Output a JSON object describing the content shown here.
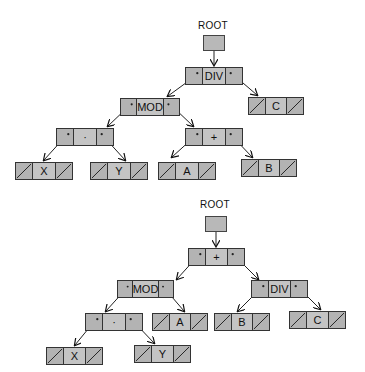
{
  "diagram": {
    "type": "expression-tree-linked-list",
    "trees": [
      {
        "root_label": "ROOT",
        "nodes": {
          "div": {
            "value": "DIV",
            "left": "mod",
            "right": "c"
          },
          "mod": {
            "value": "MOD",
            "left": "times",
            "right": "plus"
          },
          "times": {
            "value": "·",
            "left": "x",
            "right": "y"
          },
          "plus": {
            "value": "+",
            "left": "a",
            "right": "b"
          },
          "x": {
            "value": "X",
            "left": null,
            "right": null
          },
          "y": {
            "value": "Y",
            "left": null,
            "right": null
          },
          "a": {
            "value": "A",
            "left": null,
            "right": null
          },
          "b": {
            "value": "B",
            "left": null,
            "right": null
          },
          "c": {
            "value": "C",
            "left": null,
            "right": null
          }
        }
      },
      {
        "root_label": "ROOT",
        "nodes": {
          "plus": {
            "value": "+",
            "left": "mod",
            "right": "div"
          },
          "mod": {
            "value": "MOD",
            "left": "times",
            "right": "a"
          },
          "div": {
            "value": "DIV",
            "left": "b",
            "right": "c"
          },
          "times": {
            "value": "·",
            "left": "x",
            "right": "y"
          },
          "x": {
            "value": "X",
            "left": null,
            "right": null
          },
          "y": {
            "value": "Y",
            "left": null,
            "right": null
          },
          "a": {
            "value": "A",
            "left": null,
            "right": null
          },
          "b": {
            "value": "B",
            "left": null,
            "right": null
          },
          "c": {
            "value": "C",
            "left": null,
            "right": null
          }
        }
      }
    ]
  }
}
